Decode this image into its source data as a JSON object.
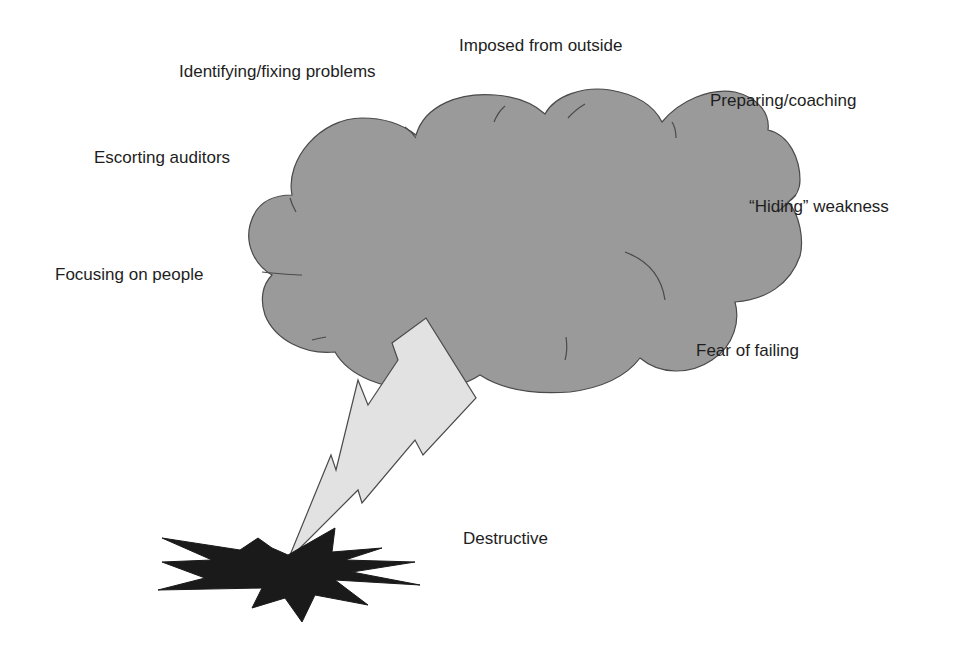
{
  "diagram": {
    "type": "metaphor-illustration",
    "central_shape": "storm-cloud",
    "labels": [
      {
        "id": "imposed",
        "text": "Imposed from outside"
      },
      {
        "id": "identifying",
        "text": "Identifying/fixing problems"
      },
      {
        "id": "preparing",
        "text": "Preparing/coaching"
      },
      {
        "id": "escorting",
        "text": "Escorting auditors"
      },
      {
        "id": "hiding",
        "text": "“Hiding” weakness"
      },
      {
        "id": "focusing",
        "text": "Focusing on people"
      },
      {
        "id": "fear",
        "text": "Fear of failing"
      },
      {
        "id": "destructive",
        "text": "Destructive"
      }
    ],
    "colors": {
      "cloud_fill": "#9a9a9a",
      "cloud_stroke": "#4a4a4a",
      "lightning_fill": "#e2e2e2",
      "lightning_stroke": "#4a4a4a",
      "burst_fill": "#1a1a1a",
      "text": "#1e1e1e"
    }
  }
}
